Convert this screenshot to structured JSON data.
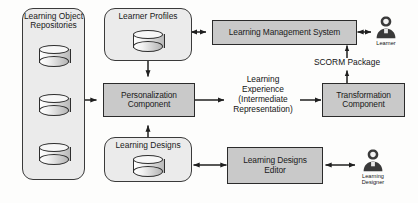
{
  "diagram": {
    "colors": {
      "process_fill": "#c9c9c9",
      "store_fill": "#ebebeb",
      "stroke": "#2b2b2b",
      "background": "#fdfdfc",
      "actor": "#3a3a3a"
    },
    "nodes": {
      "learning_object_repositories": {
        "label": "Learning\nObject\nRepositories",
        "kind": "datastore-group",
        "cylinder_count": 3
      },
      "learner_profiles": {
        "label": "Learner Profiles",
        "kind": "datastore",
        "cylinder_count": 1
      },
      "learning_designs": {
        "label": "Learning Designs",
        "kind": "datastore",
        "cylinder_count": 1
      },
      "personalization_component": {
        "label": "Personalization\nComponent",
        "kind": "process"
      },
      "transformation_component": {
        "label": "Transformation\nComponent",
        "kind": "process"
      },
      "learning_management_system": {
        "label": "Learning Management System",
        "kind": "process"
      },
      "learning_designs_editor": {
        "label": "Learning Designs\nEditor",
        "kind": "process"
      }
    },
    "actors": {
      "learner": {
        "caption": "Learner",
        "icon": "person-icon"
      },
      "learning_designer": {
        "caption": "Learning\nDesigner",
        "icon": "person-icon"
      }
    },
    "edge_labels": {
      "learning_experience": "Learning\nExperience\n(Intermediate\nRepresentation)",
      "scorm_package": "SCORM Package"
    },
    "edges": [
      {
        "from": "learning_object_repositories",
        "to": "personalization_component",
        "arrow": "single"
      },
      {
        "from": "learner_profiles",
        "to": "personalization_component",
        "arrow": "single"
      },
      {
        "from": "learning_designs",
        "to": "personalization_component",
        "arrow": "single"
      },
      {
        "from": "learner_profiles",
        "to": "learning_management_system",
        "arrow": "double"
      },
      {
        "from": "personalization_component",
        "to": "transformation_component",
        "arrow": "single",
        "label": "learning_experience"
      },
      {
        "from": "transformation_component",
        "to": "learning_management_system",
        "arrow": "single",
        "label": "scorm_package"
      },
      {
        "from": "learning_management_system",
        "to": "learner",
        "arrow": "double"
      },
      {
        "from": "learning_designs",
        "to": "learning_designs_editor",
        "arrow": "double"
      },
      {
        "from": "learning_designs_editor",
        "to": "learning_designer",
        "arrow": "double"
      }
    ]
  }
}
